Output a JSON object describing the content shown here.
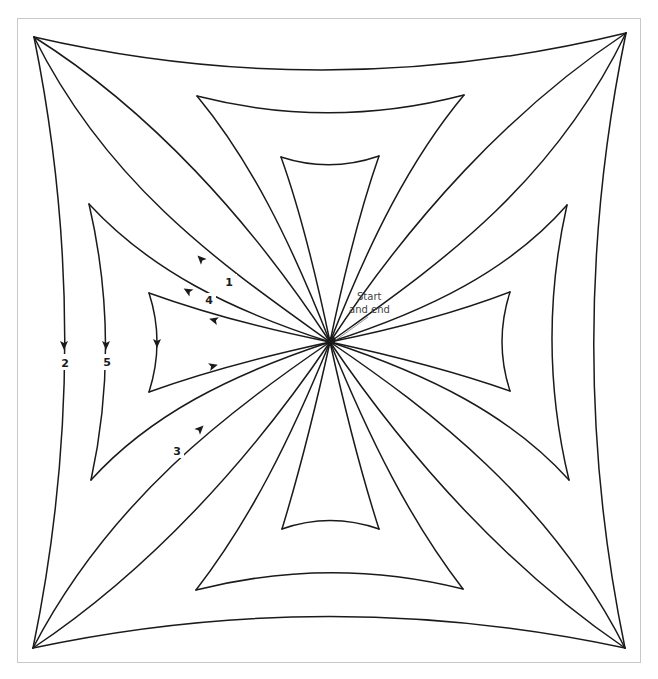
{
  "diagram": {
    "frame_color": "#c8c8c8",
    "line_color": "#1a1a1a",
    "center": [
      330,
      342
    ],
    "start_label": {
      "line1": "Start",
      "line2": "and end",
      "x1": 357,
      "y1": 300,
      "x2": 349,
      "y2": 313,
      "pointer": [
        [
          368,
          317
        ],
        [
          336,
          340
        ]
      ]
    },
    "paths": [
      {
        "name": "outer-edge-top",
        "d": "M34,37 Q330,105 626,33"
      },
      {
        "name": "outer-edge-right",
        "d": "M626,33 Q562,343 625,648"
      },
      {
        "name": "outer-edge-bottom",
        "d": "M625,648 Q330,585 33,648"
      },
      {
        "name": "outer-edge-left",
        "d": "M33,648 Q96,343 34,37"
      },
      {
        "name": "curve-tl-upper",
        "d": "M330,342 C250,220 150,110 34,37"
      },
      {
        "name": "curve-tl-lower",
        "d": "M330,342 C230,270 110,190 34,37"
      },
      {
        "name": "curve-tr-upper",
        "d": "M330,342 C410,220 510,110 626,33"
      },
      {
        "name": "curve-tr-lower",
        "d": "M330,342 C430,270 550,190 626,33"
      },
      {
        "name": "curve-bl-upper",
        "d": "M330,342 C230,410 110,500 33,648"
      },
      {
        "name": "curve-bl-lower",
        "d": "M330,342 C250,460 150,570 33,648"
      },
      {
        "name": "curve-br-upper",
        "d": "M330,342 C430,410 550,500 625,648"
      },
      {
        "name": "curve-br-lower",
        "d": "M330,342 C410,460 510,570 625,648"
      },
      {
        "name": "top-outer-trap-edge",
        "d": "M197,96 Q330,130 464,95"
      },
      {
        "name": "top-outer-trap-left",
        "d": "M330,342 C290,240 250,160 197,96"
      },
      {
        "name": "top-outer-trap-right",
        "d": "M330,342 C370,240 410,160 464,95"
      },
      {
        "name": "top-inner-trap-edge",
        "d": "M281,157 Q330,173 379,156"
      },
      {
        "name": "top-inner-trap-left",
        "d": "M330,342 C315,270 300,210 281,157"
      },
      {
        "name": "top-inner-trap-right",
        "d": "M330,342 C345,270 360,210 379,156"
      },
      {
        "name": "bottom-outer-trap-edge",
        "d": "M196,590 Q330,556 463,589"
      },
      {
        "name": "bottom-outer-trap-left",
        "d": "M330,342 C290,440 250,520 196,590"
      },
      {
        "name": "bottom-outer-trap-right",
        "d": "M330,342 C370,440 410,520 463,589"
      },
      {
        "name": "bottom-inner-trap-edge",
        "d": "M282,529 Q330,512 379,529"
      },
      {
        "name": "bottom-inner-trap-left",
        "d": "M330,342 C315,410 300,470 282,529"
      },
      {
        "name": "bottom-inner-trap-right",
        "d": "M330,342 C345,410 360,470 379,529"
      },
      {
        "name": "left-outer-trap-edge",
        "d": "M89,204 Q121,342 91,480"
      },
      {
        "name": "left-outer-trap-top",
        "d": "M330,342 C230,310 150,270 89,204"
      },
      {
        "name": "left-outer-trap-bottom",
        "d": "M330,342 C230,375 150,415 91,480"
      },
      {
        "name": "left-inner-trap-edge",
        "d": "M149,293 Q165,342 149,392"
      },
      {
        "name": "left-inner-trap-top",
        "d": "M330,342 C270,330 210,315 149,293"
      },
      {
        "name": "left-inner-trap-bottom",
        "d": "M330,342 C270,355 210,370 149,392"
      },
      {
        "name": "right-outer-trap-edge",
        "d": "M567,205 Q536,343 569,480"
      },
      {
        "name": "right-outer-trap-top",
        "d": "M330,342 C430,310 510,270 567,205"
      },
      {
        "name": "right-outer-trap-bottom",
        "d": "M330,342 C430,375 510,415 569,480"
      },
      {
        "name": "right-inner-trap-edge",
        "d": "M510,292 Q494,342 510,391"
      },
      {
        "name": "right-inner-trap-top",
        "d": "M330,342 C390,330 450,315 510,292"
      },
      {
        "name": "right-inner-trap-bottom",
        "d": "M330,342 C390,355 450,370 510,391"
      }
    ],
    "arrows": [
      {
        "name": "arrow-1",
        "x": 201,
        "y": 259,
        "angle": -135
      },
      {
        "name": "arrow-4",
        "x": 188,
        "y": 291,
        "angle": -150
      },
      {
        "name": "arrow-left-inner-top",
        "x": 214,
        "y": 320,
        "angle": -165
      },
      {
        "name": "arrow-2",
        "x": 64,
        "y": 345,
        "angle": 90
      },
      {
        "name": "arrow-5",
        "x": 106,
        "y": 345,
        "angle": 90
      },
      {
        "name": "arrow-left-inner-edge",
        "x": 157,
        "y": 343,
        "angle": 90
      },
      {
        "name": "arrow-left-inner-bottom",
        "x": 213,
        "y": 366,
        "angle": -15
      },
      {
        "name": "arrow-3",
        "x": 200,
        "y": 429,
        "angle": -45
      }
    ],
    "labels": [
      {
        "name": "step-label-1",
        "text": "1",
        "x": 229,
        "y": 286
      },
      {
        "name": "step-label-4",
        "text": "4",
        "x": 209,
        "y": 304
      },
      {
        "name": "step-label-2",
        "text": "2",
        "x": 65,
        "y": 367
      },
      {
        "name": "step-label-5",
        "text": "5",
        "x": 107,
        "y": 366
      },
      {
        "name": "step-label-3",
        "text": "3",
        "x": 177,
        "y": 455
      }
    ],
    "label_gaps": [
      {
        "x": 221,
        "y": 274,
        "w": 16,
        "h": 15
      },
      {
        "x": 202,
        "y": 293,
        "w": 14,
        "h": 14
      },
      {
        "x": 58,
        "y": 354,
        "w": 14,
        "h": 16
      },
      {
        "x": 100,
        "y": 354,
        "w": 14,
        "h": 16
      },
      {
        "x": 170,
        "y": 443,
        "w": 14,
        "h": 15
      }
    ]
  }
}
